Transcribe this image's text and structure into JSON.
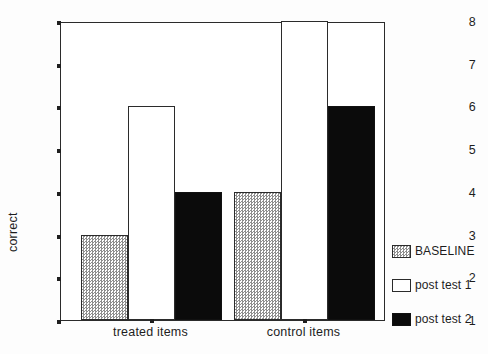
{
  "chart_data": {
    "type": "bar",
    "title": "",
    "xlabel": "",
    "ylabel": "correct",
    "ylim": [
      1,
      8
    ],
    "yticks": [
      1,
      2,
      3,
      4,
      5,
      6,
      7,
      8
    ],
    "ytick_labels": [
      "1",
      "2",
      "3",
      "4",
      "5",
      "6",
      "7",
      "8"
    ],
    "grid": false,
    "legend_position": "right",
    "categories": [
      "treated items",
      "control items"
    ],
    "series": [
      {
        "name": "BASELINE",
        "values": [
          3,
          4
        ],
        "fill": "hatched-gray",
        "color": "#8e8e8e"
      },
      {
        "name": "post test 1",
        "values": [
          6,
          8
        ],
        "fill": "white",
        "color": "#ffffff"
      },
      {
        "name": "post test 2",
        "values": [
          4,
          6
        ],
        "fill": "black",
        "color": "#0b0b0b"
      }
    ]
  },
  "axes": {
    "y_axis_label": "correct",
    "y_tick_labels": [
      "8",
      "7",
      "6",
      "5",
      "4",
      "3",
      "2",
      "1"
    ],
    "x_tick_labels": [
      "treated items",
      "control items"
    ]
  },
  "legend": {
    "entries": [
      {
        "label": "BASELINE",
        "swatch": "hatch"
      },
      {
        "label": "post test 1",
        "swatch": "white"
      },
      {
        "label": "post test 2",
        "swatch": "black"
      }
    ]
  }
}
